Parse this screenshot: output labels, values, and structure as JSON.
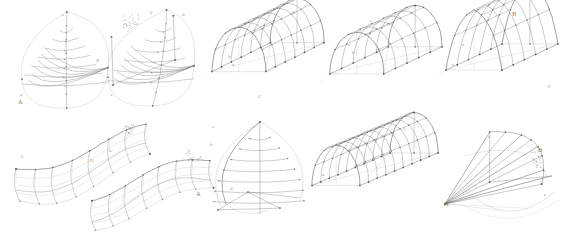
{
  "sheet": {
    "title": "Hand-drawn geometric constructions of vaulted surfaces",
    "medium": "pencil on paper scan",
    "background_color": "#ffffff",
    "ink_color": "#7a7a74",
    "ink_color_dark": "#55554f",
    "ink_color_light": "#b8b8b2",
    "width": 567,
    "height": 246,
    "rows": 2,
    "figures_per_row": [
      4,
      4
    ]
  },
  "figures": [
    {
      "id": "fig-1",
      "name": "pointed-dome-meridian-net",
      "row": 1,
      "col": 1,
      "type": "dome",
      "x": 22,
      "y": 12,
      "w": 86,
      "h": 96,
      "labels": [
        {
          "text": "A",
          "x": 18,
          "y": 104,
          "size": "big"
        },
        {
          "text": "a",
          "x": 20,
          "y": 96,
          "size": "small"
        },
        {
          "text": "c",
          "x": 62,
          "y": 16,
          "size": "small"
        },
        {
          "text": "B",
          "x": 96,
          "y": 62,
          "size": "small"
        }
      ],
      "rings": 7,
      "meridians": 6
    },
    {
      "id": "fig-2",
      "name": "tilted-dome-axonometric",
      "row": 1,
      "col": 2,
      "type": "dome-tilted",
      "x": 108,
      "y": 10,
      "w": 86,
      "h": 96,
      "labels": [
        {
          "text": "b",
          "x": 150,
          "y": 14,
          "size": "small"
        },
        {
          "text": "d",
          "x": 182,
          "y": 16,
          "size": "small"
        },
        {
          "text": "x",
          "x": 110,
          "y": 96,
          "size": "small"
        }
      ],
      "rings": 6,
      "meridians": 6
    },
    {
      "id": "fig-3",
      "name": "barrel-vault-grid-left",
      "row": 1,
      "col": 3,
      "type": "barrel-vault",
      "x": 212,
      "y": 12,
      "w": 112,
      "h": 96,
      "labels": [
        {
          "text": "B",
          "x": 292,
          "y": 14,
          "size": "small"
        },
        {
          "text": "b",
          "x": 228,
          "y": 58,
          "size": "small"
        },
        {
          "text": "a",
          "x": 232,
          "y": 66,
          "size": "small"
        },
        {
          "text": "C",
          "x": 258,
          "y": 98,
          "size": "small"
        }
      ],
      "ribs": 6,
      "courses": 5
    },
    {
      "id": "fig-4",
      "name": "barrel-vault-grid-mid",
      "row": 1,
      "col": 4,
      "type": "barrel-vault",
      "x": 330,
      "y": 18,
      "w": 112,
      "h": 90,
      "labels": [
        {
          "text": "c",
          "x": 370,
          "y": 22,
          "size": "small"
        },
        {
          "text": "a",
          "x": 348,
          "y": 46,
          "size": "small"
        },
        {
          "text": "b",
          "x": 352,
          "y": 54,
          "size": "small"
        }
      ],
      "ribs": 5,
      "courses": 4
    },
    {
      "id": "fig-5",
      "name": "pointed-vault-perspective",
      "row": 1,
      "col": 5,
      "type": "pointed-vault",
      "x": 446,
      "y": 8,
      "w": 112,
      "h": 100,
      "labels": [
        {
          "text": "B",
          "x": 512,
          "y": 16,
          "size": "big"
        },
        {
          "text": "a",
          "x": 462,
          "y": 46,
          "size": "small"
        },
        {
          "text": "c",
          "x": 452,
          "y": 66,
          "size": "small"
        },
        {
          "text": "F",
          "x": 548,
          "y": 88,
          "size": "small"
        }
      ],
      "ribs": 5,
      "courses": 4
    },
    {
      "id": "fig-6",
      "name": "undulating-ribbon-vault-upper",
      "row": 2,
      "col": 1,
      "type": "wave-vault",
      "x": 16,
      "y": 120,
      "w": 130,
      "h": 70,
      "labels": [
        {
          "text": "A",
          "x": 20,
          "y": 158,
          "size": "small"
        },
        {
          "text": "H",
          "x": 90,
          "y": 162,
          "size": "small"
        },
        {
          "text": "B",
          "x": 128,
          "y": 130,
          "size": "small"
        }
      ],
      "bays": 3
    },
    {
      "id": "fig-7",
      "name": "undulating-ribbon-vault-lower",
      "row": 2,
      "col": 2,
      "type": "wave-vault",
      "x": 92,
      "y": 148,
      "w": 118,
      "h": 64,
      "labels": [
        {
          "text": "A",
          "x": 108,
          "y": 152,
          "size": "small"
        }
      ],
      "bays": 3
    },
    {
      "id": "fig-8",
      "name": "elevation-dome-horizontal-courses",
      "row": 2,
      "col": 3,
      "type": "dome-elevation",
      "x": 208,
      "y": 122,
      "w": 100,
      "h": 100,
      "labels": [
        {
          "text": "a",
          "x": 212,
          "y": 128,
          "size": "small"
        },
        {
          "text": "b",
          "x": 210,
          "y": 146,
          "size": "small"
        },
        {
          "text": "d",
          "x": 230,
          "y": 190,
          "size": "small"
        },
        {
          "text": "A",
          "x": 196,
          "y": 196,
          "size": "big"
        }
      ],
      "courses": 7,
      "meridians": 4
    },
    {
      "id": "fig-9",
      "name": "long-barrel-vault-grid",
      "row": 2,
      "col": 4,
      "type": "barrel-vault-long",
      "x": 312,
      "y": 126,
      "w": 126,
      "h": 96,
      "labels": [
        {
          "text": "A",
          "x": 402,
          "y": 130,
          "size": "small"
        },
        {
          "text": "a",
          "x": 322,
          "y": 176,
          "size": "small"
        }
      ],
      "ribs": 9,
      "courses": 5
    },
    {
      "id": "fig-10",
      "name": "conoid-vault-perspective",
      "row": 2,
      "col": 5,
      "type": "conoid",
      "x": 440,
      "y": 126,
      "w": 124,
      "h": 100,
      "labels": [
        {
          "text": "A",
          "x": 444,
          "y": 206,
          "size": "big"
        },
        {
          "text": "B",
          "x": 538,
          "y": 152,
          "size": "big"
        },
        {
          "text": "a",
          "x": 488,
          "y": 138,
          "size": "small"
        },
        {
          "text": "c",
          "x": 544,
          "y": 196,
          "size": "small"
        }
      ],
      "rays": 7
    }
  ],
  "colors": {
    "ink": "#7a7a74",
    "ink_dark": "#55554f",
    "ink_light": "#b9b9b3",
    "ink_faint": "#d4d4ce",
    "node": "#5a5a54",
    "paper": "#ffffff"
  }
}
